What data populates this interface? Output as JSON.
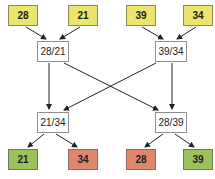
{
  "diagram": {
    "inputs": [
      {
        "label": "28",
        "color": "#ece56b"
      },
      {
        "label": "21",
        "color": "#ece56b"
      },
      {
        "label": "39",
        "color": "#ece56b"
      },
      {
        "label": "34",
        "color": "#ece56b"
      }
    ],
    "stage1": [
      {
        "label": "28/21"
      },
      {
        "label": "39/34"
      }
    ],
    "stage2": [
      {
        "label": "21/34"
      },
      {
        "label": "28/39"
      }
    ],
    "outputs": [
      {
        "label": "21",
        "status": "winner",
        "color": "#9bc25a"
      },
      {
        "label": "34",
        "status": "loser",
        "color": "#e0866b"
      },
      {
        "label": "28",
        "status": "loser",
        "color": "#e0866b"
      },
      {
        "label": "39",
        "status": "winner",
        "color": "#9bc25a"
      }
    ]
  }
}
